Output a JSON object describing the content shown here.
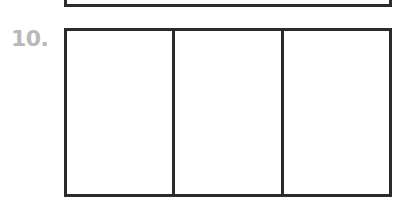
{
  "worksheet": {
    "previous_item": {
      "visible": "partial-box-bottom-edge"
    },
    "item": {
      "number_label": "10.",
      "box": {
        "columns": 3,
        "rows": 1,
        "cells": [
          "",
          "",
          ""
        ]
      }
    },
    "colors": {
      "label": "#b9b9b9",
      "stroke": "#2b2b2b",
      "background": "#ffffff"
    }
  }
}
